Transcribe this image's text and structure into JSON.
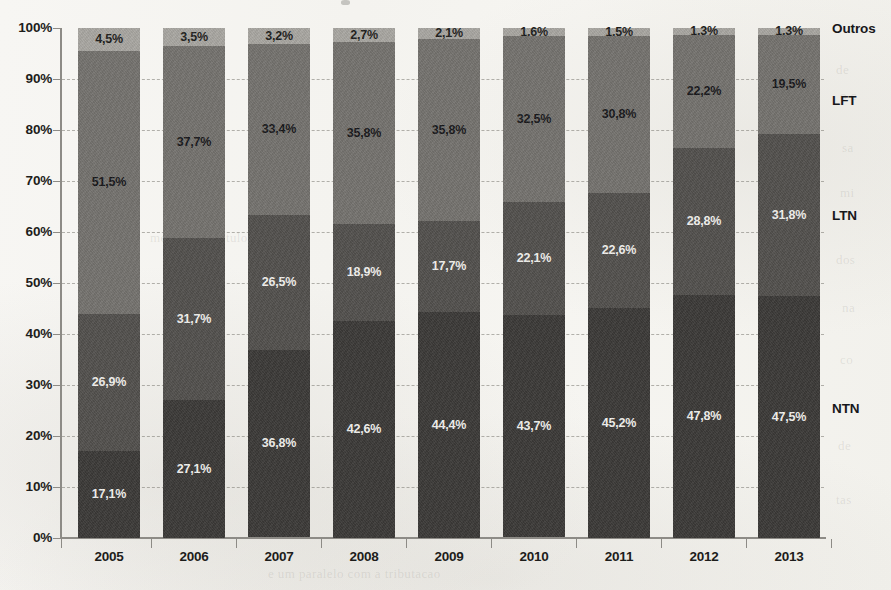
{
  "chart_data": {
    "type": "bar",
    "subtype": "stacked-100-percent",
    "title": "",
    "xlabel": "",
    "ylabel": "",
    "ylim": [
      0,
      100
    ],
    "ytick_labels": [
      "0%",
      "10%",
      "20%",
      "30%",
      "40%",
      "50%",
      "60%",
      "70%",
      "80%",
      "90%",
      "100%"
    ],
    "ytick_values": [
      0,
      10,
      20,
      30,
      40,
      50,
      60,
      70,
      80,
      90,
      100
    ],
    "grid": true,
    "legend_position": "right-of-plot-inline",
    "categories": [
      "2005",
      "2006",
      "2007",
      "2008",
      "2009",
      "2010",
      "2011",
      "2012",
      "2013"
    ],
    "series": [
      {
        "name": "NTN",
        "color": "#3b3937",
        "values": [
          17.1,
          27.1,
          36.8,
          42.6,
          44.4,
          43.7,
          45.2,
          47.8,
          47.5
        ],
        "labels": [
          "17,1%",
          "27,1%",
          "36,8%",
          "42,6%",
          "44,4%",
          "43,7%",
          "45,2%",
          "47,8%",
          "47,5%"
        ]
      },
      {
        "name": "LTN",
        "color": "#52504d",
        "values": [
          26.9,
          31.7,
          26.5,
          18.9,
          17.7,
          22.1,
          22.6,
          28.8,
          31.8
        ],
        "labels": [
          "26,9%",
          "31,7%",
          "26,5%",
          "18,9%",
          "17,7%",
          "22,1%",
          "22,6%",
          "28,8%",
          "31,8%"
        ]
      },
      {
        "name": "LFT",
        "color": "#74726e",
        "values": [
          51.5,
          37.7,
          33.4,
          35.8,
          35.8,
          32.5,
          30.8,
          22.2,
          19.5
        ],
        "labels": [
          "51,5%",
          "37,7%",
          "33,4%",
          "35,8%",
          "35,8%",
          "32,5%",
          "30,8%",
          "22,2%",
          "19,5%"
        ]
      },
      {
        "name": "Outros",
        "color": "#a8a6a1",
        "values": [
          4.5,
          3.5,
          3.2,
          2.7,
          2.1,
          1.6,
          1.5,
          1.3,
          1.3
        ],
        "labels": [
          "4,5%",
          "3,5%",
          "3,2%",
          "2,7%",
          "2,1%",
          "1,6%",
          "1,5%",
          "1,3%",
          "1,3%"
        ]
      }
    ]
  },
  "series_labels": [
    {
      "text": "Outros",
      "top": 21
    },
    {
      "text": "LFT",
      "top": 93
    },
    {
      "text": "LTN",
      "top": 208
    },
    {
      "text": "NTN",
      "top": 401
    }
  ],
  "background_bleed": [
    {
      "text": "de",
      "left": 836,
      "top": 62
    },
    {
      "text": "o c",
      "left": 840,
      "top": 88
    },
    {
      "text": "sa",
      "left": 842,
      "top": 140
    },
    {
      "text": "mi",
      "left": 840,
      "top": 185
    },
    {
      "text": "dos",
      "left": 836,
      "top": 252
    },
    {
      "text": "na",
      "left": 842,
      "top": 300
    },
    {
      "text": "co",
      "left": 840,
      "top": 352
    },
    {
      "text": "de",
      "left": 838,
      "top": 438
    },
    {
      "text": "tas",
      "left": 836,
      "top": 492
    },
    {
      "text": "e um paralelo com a tributacao",
      "left": 268,
      "top": 566
    },
    {
      "text": "mercado de titulos",
      "left": 150,
      "top": 230
    },
    {
      "text": "financeiro",
      "left": 420,
      "top": 410
    }
  ]
}
